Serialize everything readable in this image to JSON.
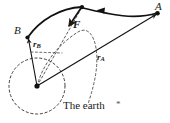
{
  "figure": {
    "type": "orbital-mechanics-diagram",
    "caption": "The earth",
    "caption_mark": "*",
    "labels": {
      "point_a": "A",
      "point_b": "B",
      "force": "F",
      "radius_b_symbol": "r",
      "radius_b_subscript": "B",
      "radius_a_symbol": "r",
      "radius_a_subscript": "A"
    },
    "colors": {
      "stroke": "#1a1a1a",
      "dashed": "#4a4a4a",
      "background": "#ffffff",
      "text": "#1a1a1a"
    },
    "geometry": {
      "point_a": [
        158,
        13
      ],
      "point_b": [
        27,
        37
      ],
      "apex": [
        82,
        7
      ],
      "earth_center": [
        37,
        86
      ],
      "earth_radius": 28,
      "force_arrow_tip": [
        67,
        28
      ],
      "transfer_arrow_tip": [
        97,
        11
      ]
    }
  }
}
